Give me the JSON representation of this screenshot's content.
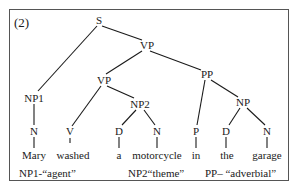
{
  "figure": {
    "number": "(2)",
    "nodes": {
      "S": "S",
      "VP_top": "VP",
      "VP_low": "VP",
      "PP": "PP",
      "NP1": "NP1",
      "NP2": "NP2",
      "NP": "NP",
      "N1": "N",
      "V": "V",
      "D1": "D",
      "N2": "N",
      "P": "P",
      "D2": "D",
      "N3": "N"
    },
    "words": [
      "Mary",
      "washed",
      "a",
      "motorcycle",
      "in",
      "the",
      "garage"
    ],
    "roles": {
      "agent": "NP1-“agent”",
      "theme": "NP2“theme”",
      "adverbial": "PP– “adverbial”"
    }
  }
}
